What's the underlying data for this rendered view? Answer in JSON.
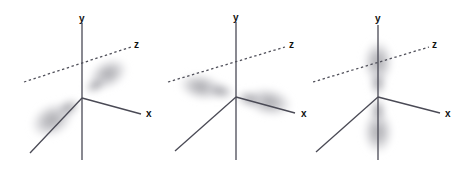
{
  "figure": {
    "title": "",
    "background_color": "#ffffff",
    "panel_count": 3
  },
  "style": {
    "axis_color": "#4a4a55",
    "axis_dashed_color": "#50505a",
    "label_color": "#111111",
    "lobe_color": "#b9b9bd",
    "lobe_core_color": "#a9a9ae",
    "lobe_edge_color": "#d8d8dc"
  },
  "panels": [
    {
      "id": "orbital-pz",
      "name": "p-orbital-z",
      "origin": {
        "x": 82,
        "y": 98
      },
      "axes": [
        {
          "name": "y",
          "label": "y",
          "kind": "solid-vertical",
          "x1": 82,
          "y1": 23,
          "x2": 82,
          "y2": 160,
          "label_x": 79,
          "label_y": 22
        },
        {
          "name": "x",
          "label": "x",
          "kind": "solid",
          "x1": 82,
          "y1": 98,
          "x2": 141,
          "y2": 114,
          "label_x": 146,
          "label_y": 117
        },
        {
          "name": "z",
          "label": "z",
          "kind": "dashed",
          "x1": 24,
          "y1": 82,
          "x2": 131,
          "y2": 47,
          "label_x": 134,
          "label_y": 48
        },
        {
          "name": "x-negative",
          "label": "",
          "kind": "solid",
          "x1": 82,
          "y1": 98,
          "x2": 30,
          "y2": 153,
          "label_x": 0,
          "label_y": 0
        }
      ],
      "lobes": [
        {
          "name": "lobe-upper-right",
          "cx": 108,
          "cy": 74,
          "rx": 22,
          "ry": 15,
          "rotate": -28
        },
        {
          "name": "lobe-lower-left",
          "cx": 53,
          "cy": 119,
          "rx": 25,
          "ry": 17,
          "rotate": -28
        }
      ]
    },
    {
      "id": "orbital-px",
      "name": "p-orbital-x",
      "origin": {
        "x": 80,
        "y": 97
      },
      "axes": [
        {
          "name": "y",
          "label": "y",
          "kind": "solid-vertical",
          "x1": 80,
          "y1": 22,
          "x2": 80,
          "y2": 160,
          "label_x": 77,
          "label_y": 21
        },
        {
          "name": "x",
          "label": "x",
          "kind": "solid",
          "x1": 80,
          "y1": 97,
          "x2": 139,
          "y2": 113,
          "label_x": 145,
          "label_y": 117
        },
        {
          "name": "z",
          "label": "z",
          "kind": "dashed",
          "x1": 12,
          "y1": 82,
          "x2": 129,
          "y2": 47,
          "label_x": 133,
          "label_y": 48
        },
        {
          "name": "z-negative",
          "label": "",
          "kind": "solid",
          "x1": 80,
          "y1": 97,
          "x2": 19,
          "y2": 151
        },
        {
          "name": "x-negative-dashed",
          "label": "",
          "kind": "dashed-short",
          "x1": 80,
          "y1": 97,
          "x2": 6,
          "y2": 82
        }
      ],
      "lobes": [
        {
          "name": "lobe-right",
          "cx": 112,
          "cy": 103,
          "rx": 26,
          "ry": 15,
          "rotate": 13
        },
        {
          "name": "lobe-left",
          "cx": 46,
          "cy": 86,
          "rx": 25,
          "ry": 14,
          "rotate": 13
        }
      ]
    },
    {
      "id": "orbital-py",
      "name": "p-orbital-y",
      "origin": {
        "x": 65,
        "y": 97
      },
      "axes": [
        {
          "name": "y",
          "label": "y",
          "kind": "solid-vertical",
          "x1": 65,
          "y1": 25,
          "x2": 65,
          "y2": 160,
          "label_x": 62,
          "label_y": 22
        },
        {
          "name": "x",
          "label": "x",
          "kind": "solid",
          "x1": 65,
          "y1": 97,
          "x2": 127,
          "y2": 113,
          "label_x": 132,
          "label_y": 117
        },
        {
          "name": "z",
          "label": "z",
          "kind": "dashed",
          "x1": 0,
          "y1": 82,
          "x2": 116,
          "y2": 47,
          "label_x": 119,
          "label_y": 48
        },
        {
          "name": "z-negative",
          "label": "",
          "kind": "solid",
          "x1": 65,
          "y1": 97,
          "x2": 3,
          "y2": 152
        }
      ],
      "lobes": [
        {
          "name": "lobe-top",
          "cx": 65,
          "cy": 66,
          "rx": 16,
          "ry": 26,
          "rotate": 0
        },
        {
          "name": "lobe-bottom",
          "cx": 65,
          "cy": 130,
          "rx": 16,
          "ry": 26,
          "rotate": 0
        }
      ]
    }
  ]
}
